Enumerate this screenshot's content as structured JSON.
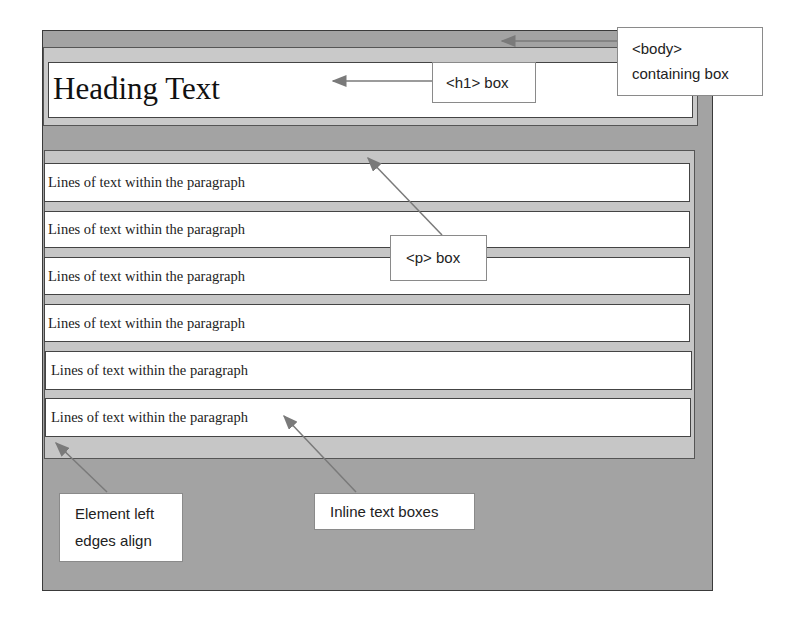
{
  "diagram": {
    "heading_text": "Heading Text",
    "paragraph_lines": [
      "Lines of text within the paragraph",
      "Lines of text within the paragraph",
      "Lines of text within the paragraph",
      "Lines of text within the paragraph",
      "Lines of text within the paragraph",
      "Lines of text within the paragraph"
    ],
    "callouts": {
      "body_line1": "<body>",
      "body_line2": "containing box",
      "h1": "<h1> box",
      "p": "<p> box",
      "left_edges_line1": "Element left",
      "left_edges_line2": "edges align",
      "inline": "Inline text boxes"
    },
    "colors": {
      "body_fill": "#a3a3a3",
      "margin_fill": "#c8c8c8",
      "box_fill": "#ffffff",
      "arrow": "#7a7a7a"
    }
  }
}
